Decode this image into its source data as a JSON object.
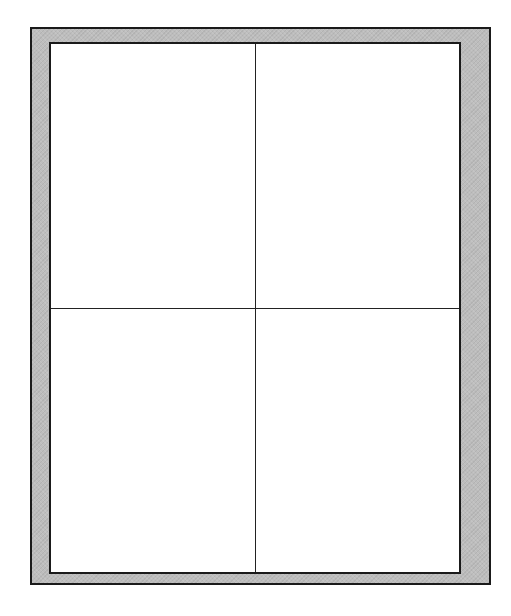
{
  "diagram": {
    "type": "framed-grid",
    "grid": {
      "columns": 2,
      "rows": 2,
      "cells": [
        {
          "row": 0,
          "col": 0,
          "label": ""
        },
        {
          "row": 0,
          "col": 1,
          "label": ""
        },
        {
          "row": 1,
          "col": 0,
          "label": ""
        },
        {
          "row": 1,
          "col": 1,
          "label": ""
        }
      ]
    },
    "colors": {
      "frame_fill": "#bdbdbd",
      "border": "#1a1a1a",
      "panel_fill": "#ffffff",
      "divider": "#222222"
    }
  }
}
